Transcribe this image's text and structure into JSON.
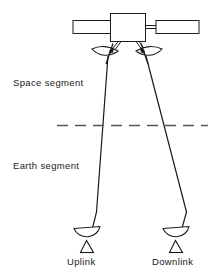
{
  "figure": {
    "kind": "satellite-communication-link-diagram",
    "background_color": "#ffffff",
    "line_color": "#1a1a1a",
    "width": 221,
    "height": 276
  },
  "labels": {
    "space_segment": "Space segment",
    "earth_segment": "Earth segment",
    "uplink": "Uplink",
    "downlink": "Downlink"
  },
  "elements": {
    "satellite_body": "satellite-bus",
    "solar_panel_left": "solar-panel-left",
    "solar_panel_right": "solar-panel-right",
    "antenna_left": "satellite-antenna-left",
    "antenna_right": "satellite-antenna-right",
    "boundary_line": "space-earth-boundary-dashed-line",
    "beam_uplink": "uplink-beam-path",
    "beam_downlink": "downlink-beam-path",
    "ground_station_left": "ground-station-dish-uplink",
    "ground_station_right": "ground-station-dish-downlink"
  }
}
